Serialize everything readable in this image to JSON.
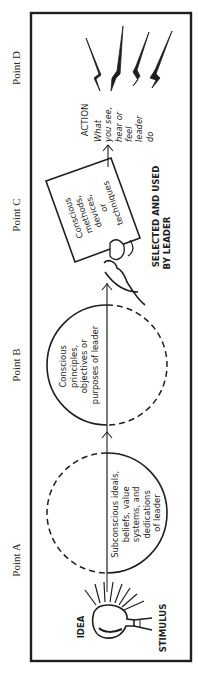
{
  "points": {
    "d": "Point  D",
    "c": "Point  C",
    "b": "Point  B",
    "a": "Point  A"
  },
  "stimulus": {
    "idea_label": "IDEA",
    "stimulus_label": "STIMULUS",
    "icon": "light-bulb-icon"
  },
  "circle_a": {
    "lines": [
      "Subconscious ideals,",
      "beliefs, value",
      "systems, and",
      "dedications",
      "of leader"
    ]
  },
  "circle_b": {
    "lines": [
      "Conscious",
      "principles,",
      "objectives or",
      "purposes of leader"
    ]
  },
  "card_c": {
    "lines": [
      "Conscious",
      "methods,",
      "devices,",
      "or",
      "techniques"
    ],
    "caption_lines": [
      "SELECTED  AND  USED",
      "BY  LEADER"
    ],
    "icon": "hand-holding-card-icon"
  },
  "action_d": {
    "title": "ACTION",
    "lines": [
      "What",
      "you see,",
      "hear or",
      "feel",
      "leader",
      "do"
    ],
    "icon": "lightning-bolts-icon"
  },
  "colors": {
    "ink": "#1e1e1e",
    "paper": "#ffffff",
    "label": "#2a2a2a"
  }
}
